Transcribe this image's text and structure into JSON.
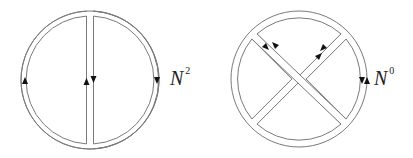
{
  "figure": {
    "diagrams": [
      {
        "id": "planar",
        "label_base": "N",
        "label_exponent": "2",
        "description": "Double-line circle with vertical chord, arrows indicating index flow"
      },
      {
        "id": "nonplanar",
        "label_base": "N",
        "label_exponent": "0",
        "description": "Double-line circle with two crossing diagonal chords, arrows indicating index flow"
      }
    ],
    "colors": {
      "line": "#7a7a7a",
      "arrow": "#111111",
      "background": "#ffffff"
    }
  }
}
